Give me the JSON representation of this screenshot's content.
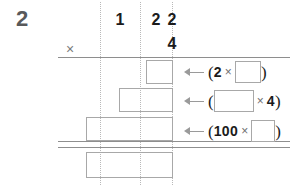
{
  "worksheet": {
    "question_number": "2",
    "operator_symbol": "×",
    "multiplication_sign": "×",
    "open_paren": "(",
    "close_paren": ")",
    "arrow_glyph": "←"
  },
  "grid": {
    "columns": [
      {
        "name": "hundreds",
        "digit": ""
      },
      {
        "name": "tens",
        "digit": "1"
      },
      {
        "name": "ones",
        "digit": "2"
      },
      {
        "name": "multiplier",
        "digit": "2"
      }
    ],
    "multiplier_row_digit": "4",
    "column_dotted_lines": 3,
    "answer_boxes": [
      {
        "name": "partial-product-1",
        "value": ""
      },
      {
        "name": "partial-product-2",
        "value": ""
      },
      {
        "name": "partial-product-3",
        "value": ""
      },
      {
        "name": "total-answer",
        "value": ""
      }
    ]
  },
  "annotations": [
    {
      "name": "annotation-partial-1",
      "left_term": "2",
      "right_term": "",
      "right_is_blank": true,
      "left_is_blank": false
    },
    {
      "name": "annotation-partial-2",
      "left_term": "",
      "right_term": "4",
      "right_is_blank": false,
      "left_is_blank": true
    },
    {
      "name": "annotation-partial-3",
      "left_term": "100",
      "right_term": "",
      "right_is_blank": true,
      "left_is_blank": false
    }
  ],
  "colors": {
    "grid_line": "#b9b9b9",
    "rule": "#8e8e8e",
    "box_border": "#a8a8a8",
    "text": "#1b1b1b",
    "qnum": "#58595b"
  }
}
